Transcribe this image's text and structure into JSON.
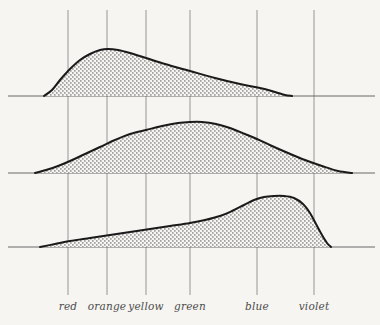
{
  "figure": {
    "background_color": "#f6f5f2",
    "ink_color": "#1a1a1a",
    "gridline_color": "#8d8d8d",
    "baseline_color": "#5a5a5a",
    "fill_pattern": "stipple-dots"
  },
  "axis": {
    "labels": [
      {
        "text": "red",
        "x": 68
      },
      {
        "text": "orange",
        "x": 107
      },
      {
        "text": "yellow",
        "x": 146
      },
      {
        "text": "green",
        "x": 190
      },
      {
        "text": "blue",
        "x": 257
      },
      {
        "text": "violet",
        "x": 314
      }
    ],
    "gridlines_x": [
      68,
      107,
      146,
      190,
      257,
      314
    ],
    "gridline_top_y": 10,
    "gridline_bottom_y": 295,
    "label_y": 300
  },
  "chart_data": {
    "type": "area",
    "title": "",
    "subtitle": "",
    "xlabel": "",
    "ylabel": "",
    "grid": true,
    "legend_position": "none",
    "categories": [
      "red",
      "orange",
      "yellow",
      "green",
      "blue",
      "violet"
    ],
    "category_x": [
      68,
      107,
      146,
      190,
      257,
      314
    ],
    "series": [
      {
        "name": "curve-1",
        "baseline_y": 96,
        "x_start": 44,
        "x_end": 292,
        "peak_x": 108,
        "peak_y": 49,
        "axis_x_start": 8,
        "axis_x_end": 375,
        "points": [
          [
            44,
            96
          ],
          [
            52,
            90
          ],
          [
            60,
            80
          ],
          [
            70,
            69
          ],
          [
            80,
            60
          ],
          [
            90,
            54
          ],
          [
            100,
            50
          ],
          [
            108,
            49
          ],
          [
            118,
            50
          ],
          [
            130,
            53
          ],
          [
            146,
            58
          ],
          [
            165,
            64
          ],
          [
            190,
            71
          ],
          [
            215,
            78
          ],
          [
            240,
            84
          ],
          [
            260,
            88
          ],
          [
            275,
            92
          ],
          [
            285,
            95
          ],
          [
            292,
            96
          ]
        ]
      },
      {
        "name": "curve-2",
        "baseline_y": 173,
        "x_start": 35,
        "x_end": 352,
        "peak_x": 190,
        "peak_y": 122,
        "axis_x_start": 8,
        "axis_x_end": 375,
        "points": [
          [
            35,
            173
          ],
          [
            46,
            170
          ],
          [
            58,
            166
          ],
          [
            70,
            161
          ],
          [
            85,
            154
          ],
          [
            100,
            147
          ],
          [
            115,
            140
          ],
          [
            130,
            134
          ],
          [
            146,
            130
          ],
          [
            162,
            126
          ],
          [
            178,
            123
          ],
          [
            190,
            122
          ],
          [
            202,
            122
          ],
          [
            216,
            124
          ],
          [
            230,
            128
          ],
          [
            245,
            134
          ],
          [
            257,
            139
          ],
          [
            272,
            146
          ],
          [
            288,
            153
          ],
          [
            305,
            160
          ],
          [
            322,
            166
          ],
          [
            338,
            171
          ],
          [
            352,
            173
          ]
        ]
      },
      {
        "name": "curve-3",
        "baseline_y": 247,
        "x_start": 40,
        "x_end": 331,
        "peak_x": 277,
        "peak_y": 197,
        "axis_x_start": 8,
        "axis_x_end": 375,
        "points": [
          [
            40,
            247
          ],
          [
            55,
            244
          ],
          [
            70,
            241
          ],
          [
            90,
            238
          ],
          [
            110,
            235
          ],
          [
            130,
            232
          ],
          [
            150,
            229
          ],
          [
            170,
            226
          ],
          [
            190,
            223
          ],
          [
            205,
            220
          ],
          [
            220,
            216
          ],
          [
            232,
            211
          ],
          [
            244,
            205
          ],
          [
            254,
            200
          ],
          [
            264,
            197
          ],
          [
            274,
            196
          ],
          [
            284,
            196
          ],
          [
            294,
            198
          ],
          [
            303,
            204
          ],
          [
            310,
            213
          ],
          [
            316,
            224
          ],
          [
            322,
            235
          ],
          [
            327,
            243
          ],
          [
            331,
            247
          ]
        ]
      }
    ]
  }
}
